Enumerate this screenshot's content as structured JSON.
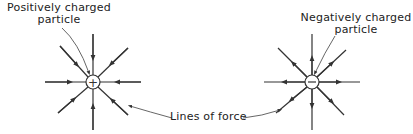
{
  "labels": {
    "positive_line1": "Positively charged",
    "positive_line2": "particle",
    "negative_line1": "Negatively charged",
    "negative_line2": "particle",
    "lines_of_force": "Lines of force"
  },
  "particles": [
    {
      "name": "positive",
      "symbol": "+",
      "cx": 93,
      "cy": 82,
      "arrow_direction": "inward"
    },
    {
      "name": "negative",
      "symbol": "−",
      "cx": 312,
      "cy": 82,
      "arrow_direction": "outward"
    }
  ],
  "colors": {
    "stroke": "#333333",
    "text": "#222222"
  }
}
